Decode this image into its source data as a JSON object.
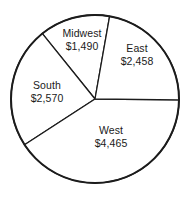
{
  "chart_data": {
    "type": "pie",
    "title": "",
    "subtitle": "",
    "xlabel": "",
    "ylabel": "",
    "grid": false,
    "legend": "none",
    "labels_position": "inside-slices",
    "value_prefix": "$",
    "total": 10983,
    "total_display": "$10,983",
    "categories": [
      "Midwest",
      "East",
      "West",
      "South"
    ],
    "values": [
      1490,
      2458,
      4465,
      2570
    ],
    "value_labels": [
      "$1,490",
      "$2,458",
      "$4,465",
      "$2,570"
    ],
    "start_angle_deg": 80,
    "direction": "clockwise",
    "slices": [
      {
        "name": "Midwest",
        "value": 1490,
        "value_display": "$1,490",
        "percent": 13.6,
        "angle_deg": 48.8,
        "start_deg": 80,
        "end_deg": 128.8,
        "fill": "#ffffff",
        "stroke": "#1c1c1c"
      },
      {
        "name": "South",
        "value": 2570,
        "value_display": "$2,570",
        "percent": 23.4,
        "angle_deg": 84.2,
        "start_deg": 128.8,
        "end_deg": 213.0,
        "fill": "#ffffff",
        "stroke": "#1c1c1c"
      },
      {
        "name": "West",
        "value": 4465,
        "value_display": "$4,465",
        "percent": 40.7,
        "angle_deg": 146.4,
        "start_deg": 213.0,
        "end_deg": 359.4,
        "fill": "#ffffff",
        "stroke": "#1c1c1c"
      },
      {
        "name": "East",
        "value": 2458,
        "value_display": "$2,458",
        "percent": 22.4,
        "angle_deg": 80.6,
        "start_deg": 359.4,
        "end_deg": 440.0,
        "fill": "#ffffff",
        "stroke": "#1c1c1c"
      }
    ],
    "geometry": {
      "center_x": 95,
      "center_y": 99,
      "radius": 84
    },
    "style": {
      "background": "#ffffff",
      "outline_color": "#1c1c1c",
      "divider_color": "#1c1c1c",
      "text_color": "#1a1a1a"
    }
  },
  "labels": {
    "midwest": {
      "name": "Midwest",
      "value": "$1,490"
    },
    "east": {
      "name": "East",
      "value": "$2,458"
    },
    "south": {
      "name": "South",
      "value": "$2,570"
    },
    "west": {
      "name": "West",
      "value": "$4,465"
    }
  }
}
